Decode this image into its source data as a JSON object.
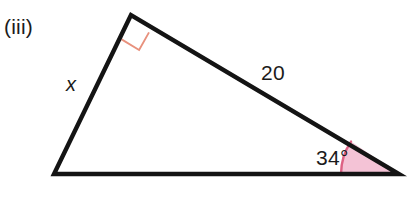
{
  "figure": {
    "part_label": "(iii)",
    "type": "right-triangle-diagram",
    "background_color": "#ffffff",
    "stroke_color": "#141414",
    "stroke_width": 4,
    "vertices": {
      "apex": {
        "name": "right-angle-vertex",
        "x": 131,
        "y": 15
      },
      "left": {
        "name": "left-vertex",
        "x": 54,
        "y": 174
      },
      "right": {
        "name": "marked-angle-vertex",
        "x": 399,
        "y": 174
      }
    },
    "labels": {
      "side_x": {
        "text": "x",
        "style": "italic",
        "x": 73,
        "y": 84
      },
      "side_20": {
        "text": "20",
        "x": 275,
        "y": 72
      },
      "angle_34": {
        "text": "34°",
        "x": 338,
        "y": 157
      }
    },
    "angle_marker": {
      "name": "angle-arc-34",
      "value": "34°",
      "fill_color": "#f4c3d6",
      "arc_color": "#dd6184",
      "arc_width": 2.4,
      "radius": 58
    },
    "right_angle_marker": {
      "name": "right-angle-square",
      "value": "90°",
      "stroke_color": "#e8917d",
      "stroke_width": 1.8,
      "size": 26
    }
  }
}
